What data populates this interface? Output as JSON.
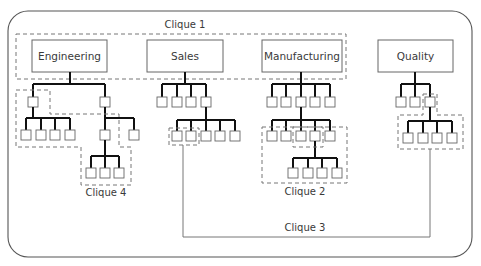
{
  "diagram": {
    "type": "organization-chart-with-cliques",
    "departments": [
      {
        "id": "engineering",
        "label": "Engineering"
      },
      {
        "id": "sales",
        "label": "Sales"
      },
      {
        "id": "manufacturing",
        "label": "Manufacturing"
      },
      {
        "id": "quality",
        "label": "Quality"
      }
    ],
    "cliques": [
      {
        "id": "clique-1",
        "label": "Clique 1",
        "description": "Spans department heads of Engineering, Sales and Manufacturing"
      },
      {
        "id": "clique-2",
        "label": "Clique 2",
        "description": "Within Manufacturing lower levels"
      },
      {
        "id": "clique-3",
        "label": "Clique 3",
        "description": "Connects Sales staff with Quality staff"
      },
      {
        "id": "clique-4",
        "label": "Clique 4",
        "description": "Within Engineering subtree"
      }
    ],
    "structure": {
      "engineering": {
        "level1": 2,
        "level2_left": 4,
        "level2_right": 2,
        "level3": 3
      },
      "sales": {
        "level1": 4,
        "level2": 5
      },
      "manufacturing": {
        "level1": 5,
        "level2": 5,
        "level3": 4
      },
      "quality": {
        "level1": 3,
        "level2": 4
      }
    }
  }
}
